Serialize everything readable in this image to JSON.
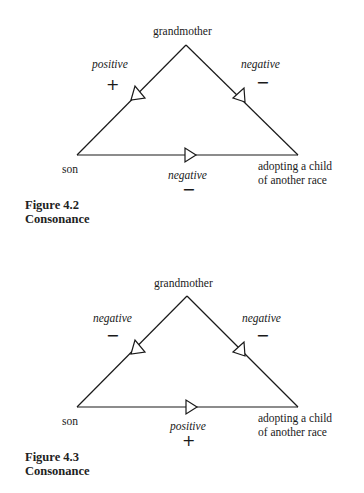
{
  "figures": [
    {
      "number_label": "Figure 4.2",
      "title": "Consonance",
      "nodes": {
        "top": "grandmother",
        "left": "son",
        "right_line1": "adopting a child",
        "right_line2": "of another race"
      },
      "edges": {
        "left": {
          "label": "positive",
          "sign": "+"
        },
        "right": {
          "label": "negative",
          "sign": "−"
        },
        "bottom": {
          "label": "negative",
          "sign": "−"
        }
      }
    },
    {
      "number_label": "Figure 4.3",
      "title": "Consonance",
      "nodes": {
        "top": "grandmother",
        "left": "son",
        "right_line1": "adopting a child",
        "right_line2": "of another race"
      },
      "edges": {
        "left": {
          "label": "negative",
          "sign": "−"
        },
        "right": {
          "label": "negative",
          "sign": "−"
        },
        "bottom": {
          "label": "positive",
          "sign": "+"
        }
      }
    }
  ],
  "colors": {
    "line": "#1a1a1a",
    "text": "#1a1a1a",
    "background": "#ffffff"
  }
}
